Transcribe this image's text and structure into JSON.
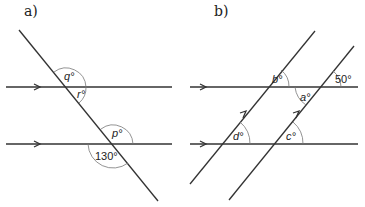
{
  "panels": [
    {
      "label": "a)",
      "angles": {
        "q": "q°",
        "r": "r°",
        "p": "p°",
        "given": "130°"
      }
    },
    {
      "label": "b)",
      "angles": {
        "b": "b°",
        "a": "a°",
        "d": "d°",
        "c": "c°",
        "given": "50°"
      }
    }
  ],
  "colors": {
    "line": "#333333",
    "arc": "#777777"
  }
}
